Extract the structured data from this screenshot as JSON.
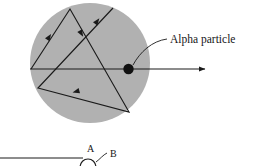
{
  "figure": {
    "type": "physics-scattering-diagram",
    "background_color": "#ffffff",
    "nucleus_disk": {
      "name": "gold-foil-atom-disk",
      "fill_color": "#b1b1b1",
      "center_x": 90,
      "center_y": 63,
      "radius": 60
    },
    "alpha_particle": {
      "label": "Alpha particle",
      "dot_color": "#111111",
      "dot_x": 128.5,
      "dot_y": 69,
      "dot_radius": 5.2
    },
    "beam": {
      "name": "incident-and-outgoing-beam",
      "color": "#1a1a1a",
      "entry_x": 30,
      "entry_y": 69,
      "exit_arrow_x": 211,
      "exit_arrow_y": 69
    },
    "scatter_path": {
      "name": "alpha-particle-trajectory",
      "color": "#1a1a1a",
      "vertices": [
        {
          "x": 31,
          "y": 69
        },
        {
          "x": 70,
          "y": 9
        },
        {
          "x": 129,
          "y": 112
        },
        {
          "x": 38,
          "y": 88
        },
        {
          "x": 113,
          "y": 8
        }
      ],
      "arrow_markers": [
        {
          "x": 48,
          "y": 41,
          "angle": -57
        },
        {
          "x": 85,
          "y": 32,
          "angle": 60
        },
        {
          "x": 83,
          "y": 96,
          "angle": 165
        },
        {
          "x": 96,
          "y": 25,
          "angle": -53
        }
      ]
    },
    "leader_line": {
      "name": "alpha-particle-callout-leader",
      "from_x": 133,
      "from_y": 64,
      "to_x": 167,
      "to_y": 39,
      "color": "#1a1a1a"
    },
    "lower_figure": {
      "name": "partial-lower-diagram",
      "baseline_y": 158,
      "baseline_from_x": 0,
      "baseline_to_x": 83,
      "label_a": "A",
      "label_b": "B",
      "label_a_x": 87,
      "label_a_y": 148,
      "label_b_x": 110,
      "label_b_y": 155,
      "arch_center_x": 88,
      "arch_y": 166,
      "arch_radius": 8,
      "leader_b_from_x": 96,
      "leader_b_from_y": 161,
      "leader_b_to_x": 106,
      "leader_b_to_y": 152,
      "line_color": "#1a1a1a"
    }
  }
}
